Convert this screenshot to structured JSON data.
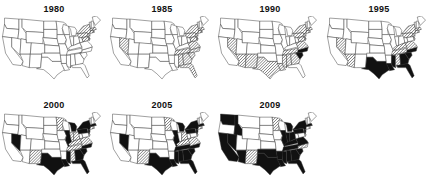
{
  "figure": {
    "panels": [
      {
        "year": "1980"
      },
      {
        "year": "1985"
      },
      {
        "year": "1990"
      },
      {
        "year": "1995"
      },
      {
        "year": "2000"
      },
      {
        "year": "2005"
      },
      {
        "year": "2009"
      }
    ]
  },
  "legend_encoding": {
    "white": "none",
    "hatched": "intermediate",
    "black": "highest"
  },
  "colors": {
    "stroke": "#333333",
    "fill_none": "#ffffff",
    "fill_high": "#111111",
    "hatch": "#444444"
  },
  "map_data": {
    "type": "choropleth-small-multiples",
    "region": "Contiguous United States",
    "categories": [
      "none",
      "hatched",
      "black"
    ],
    "states_by_year": {
      "1980": {
        "hatched": [
          "NY",
          "PA",
          "NJ",
          "MA",
          "CT",
          "RI",
          "MD",
          "DE"
        ],
        "black": []
      },
      "1985": {
        "hatched": [
          "NV",
          "NY",
          "PA",
          "NJ",
          "MA",
          "CT",
          "RI",
          "MD",
          "DE",
          "VA",
          "NC",
          "SC",
          "GA",
          "AL",
          "TN",
          "FL"
        ],
        "black": []
      },
      "1990": {
        "hatched": [
          "NV",
          "AZ",
          "NM",
          "TX",
          "LA",
          "MS",
          "AL",
          "GA",
          "TN",
          "NY",
          "PA",
          "NJ",
          "MA",
          "CT",
          "MD",
          "DE",
          "VA"
        ],
        "black": [
          "SC",
          "NC"
        ]
      },
      "1995": {
        "hatched": [
          "NV",
          "AZ",
          "AL",
          "TN",
          "KY",
          "VA",
          "NY",
          "PA",
          "NJ",
          "MA",
          "CT"
        ],
        "black": [
          "TX",
          "LA",
          "MS",
          "GA",
          "SC",
          "FL",
          "NC"
        ]
      },
      "2000": {
        "hatched": [
          "MN",
          "NM",
          "AL",
          "TN",
          "KY",
          "VA",
          "IN",
          "OH",
          "CT"
        ],
        "black": [
          "NV",
          "TX",
          "LA",
          "MS",
          "GA",
          "SC",
          "FL",
          "NC",
          "NY",
          "PA",
          "NJ",
          "MA",
          "MI",
          "IL"
        ]
      },
      "2005": {
        "hatched": [
          "MN",
          "NM",
          "KY",
          "VA",
          "OH",
          "CT"
        ],
        "black": [
          "NV",
          "TX",
          "LA",
          "MS",
          "AL",
          "GA",
          "SC",
          "FL",
          "NC",
          "TN",
          "NY",
          "PA",
          "NJ",
          "MA",
          "IL",
          "MI"
        ]
      },
      "2009": {
        "hatched": [
          "MN",
          "NM",
          "NC"
        ],
        "black": [
          "WA",
          "CA",
          "NV",
          "AZ",
          "ID",
          "TX",
          "OK",
          "LA",
          "MS",
          "AL",
          "GA",
          "SC",
          "FL",
          "TN",
          "AR",
          "NY",
          "PA",
          "NJ",
          "MA",
          "IL",
          "IN",
          "OH",
          "MI",
          "VA",
          "KY"
        ]
      }
    }
  }
}
